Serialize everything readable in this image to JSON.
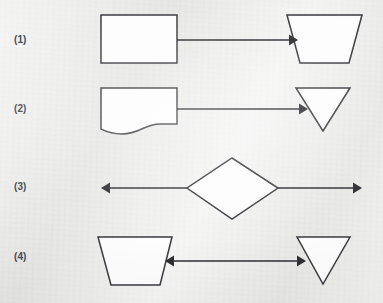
{
  "figure": {
    "title": "",
    "background_color": "#ececeb",
    "shape_fill_color": "#fdfdfd",
    "shape_stroke_color": "#3b3b40",
    "arrow_color": "#2e2e33",
    "width": 383,
    "height": 303
  },
  "rows": [
    {
      "label": "(1)",
      "label_x": 14,
      "label_y": 41,
      "left_shape": {
        "name": "rectangle",
        "points": "101,15 177,15 177,63 101,63"
      },
      "right_shape": {
        "name": "inverted-trapezoid",
        "points": "287,15 362,15 349,63 300,63"
      },
      "connector": {
        "name": "arrow-right",
        "line": "177,40 289,40",
        "head": "289,34.5 298,40 289,45.5",
        "direction": "right"
      }
    },
    {
      "label": "(2)",
      "label_x": 14,
      "label_y": 110,
      "left_shape": {
        "name": "document",
        "path": "M101,88 L177,88 L177,124 L160,124 C144,124 140,134 122,134 C110,134 105,131 101,129 Z"
      },
      "right_shape": {
        "name": "down-triangle",
        "points": "296,88 350,88 323,131"
      },
      "connector": {
        "name": "arrow-right",
        "line": "177,109 299,109",
        "head": "299,103.5 308,109 299,114.5",
        "direction": "right"
      }
    },
    {
      "label": "(3)",
      "label_x": 14,
      "label_y": 188,
      "center_shape": {
        "name": "diamond",
        "points": "232,158 278,188 232,219 187,188"
      },
      "connector_left": {
        "name": "arrow-left",
        "line": "109,188 187,188",
        "head": "110,182.5 101,188 110,193.5",
        "direction": "left"
      },
      "connector_right": {
        "name": "arrow-right",
        "line": "278,188 354,188",
        "head": "353,182.5 362,188 353,193.5",
        "direction": "right"
      }
    },
    {
      "label": "(4)",
      "label_x": 14,
      "label_y": 258,
      "left_shape": {
        "name": "trapezoid",
        "points": "98,237 172,237 160,285 111,285"
      },
      "right_shape": {
        "name": "down-triangle",
        "points": "297,237 350,237 323,284"
      },
      "connector": {
        "name": "double-arrow",
        "line": "174,261 297,261",
        "head_left": "174,255.5 165,261 174,266.5",
        "head_right": "297,255.5 306,261 297,266.5",
        "direction": "both"
      }
    }
  ],
  "diagram_data": {
    "type": "shape-relation-diagram",
    "item_count": 4,
    "description": "Four numbered rows each showing flowchart-style shapes connected by arrows."
  }
}
